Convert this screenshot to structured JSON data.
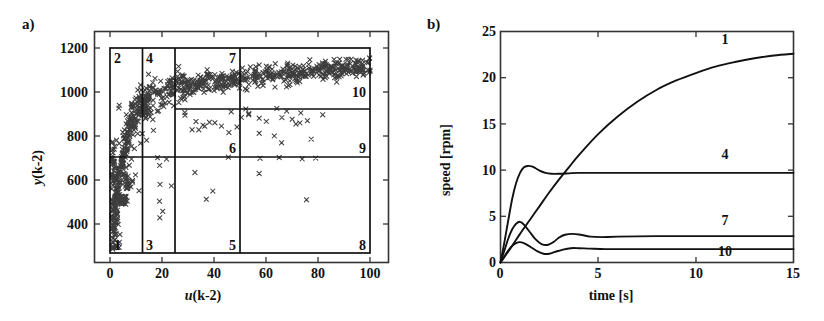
{
  "figure": {
    "panels": [
      {
        "tag": "a)",
        "type": "scatter-with-partition"
      },
      {
        "tag": "b)",
        "type": "line"
      }
    ]
  },
  "panel_a": {
    "tag": "a)",
    "xlabel_plain": "u(k-2)",
    "xlabel_var": "u",
    "xlabel_rest": "(k-2)",
    "ylabel_var": "y",
    "ylabel_rest": "(k-2)",
    "xticks": [
      "0",
      "20",
      "40",
      "60",
      "80",
      "100"
    ],
    "yticks": [
      "400",
      "600",
      "800",
      "1000",
      "1200"
    ],
    "cells": [
      {
        "id": "1",
        "label": "1"
      },
      {
        "id": "2",
        "label": "2"
      },
      {
        "id": "3",
        "label": "3"
      },
      {
        "id": "4",
        "label": "4"
      },
      {
        "id": "5",
        "label": "5"
      },
      {
        "id": "6",
        "label": "6"
      },
      {
        "id": "7",
        "label": "7"
      },
      {
        "id": "8",
        "label": "8"
      },
      {
        "id": "9",
        "label": "9"
      },
      {
        "id": "10",
        "label": "10"
      }
    ]
  },
  "panel_b": {
    "tag": "b)",
    "xlabel": "time  [s]",
    "ylabel": "speed [rpm]",
    "xticks": [
      "0",
      "5",
      "10",
      "15"
    ],
    "yticks": [
      "0",
      "5",
      "10",
      "15",
      "20",
      "25"
    ],
    "curve_labels": [
      "1",
      "4",
      "7",
      "10"
    ]
  },
  "chart_data": [
    {
      "type": "scatter",
      "panel": "a",
      "title": "",
      "xlabel": "u(k-2)",
      "ylabel": "y(k-2)",
      "xlim": [
        -8,
        112
      ],
      "ylim": [
        300,
        1290
      ],
      "xticks": [
        0,
        20,
        40,
        60,
        80,
        100
      ],
      "yticks": [
        400,
        600,
        800,
        1000,
        1200
      ],
      "grid": false,
      "marker": "x",
      "marker_color": "#3b3b3b",
      "partition": {
        "x_boundaries": [
          0,
          12.5,
          25,
          50,
          100
        ],
        "y_boundaries": [
          320,
          760,
          980,
          1215
        ],
        "description": "10 operating regimes partitioning the (u,y) plane",
        "cells": [
          {
            "label": "1",
            "x_range": [
              0,
              12.5
            ],
            "y_range": [
              320,
              760
            ],
            "label_corner": "bottom-left"
          },
          {
            "label": "2",
            "x_range": [
              0,
              12.5
            ],
            "y_range": [
              760,
              1215
            ],
            "label_corner": "top-left"
          },
          {
            "label": "3",
            "x_range": [
              12.5,
              25
            ],
            "y_range": [
              320,
              760
            ],
            "label_corner": "bottom-left"
          },
          {
            "label": "4",
            "x_range": [
              12.5,
              25
            ],
            "y_range": [
              760,
              1215
            ],
            "label_corner": "top-left"
          },
          {
            "label": "5",
            "x_range": [
              25,
              50
            ],
            "y_range": [
              320,
              760
            ],
            "label_corner": "bottom-right"
          },
          {
            "label": "6",
            "x_range": [
              25,
              50
            ],
            "y_range": [
              760,
              980
            ],
            "label_corner": "top-right"
          },
          {
            "label": "7",
            "x_range": [
              25,
              50
            ],
            "y_range": [
              980,
              1215
            ],
            "label_corner": "top-right"
          },
          {
            "label": "8",
            "x_range": [
              50,
              100
            ],
            "y_range": [
              320,
              760
            ],
            "label_corner": "bottom-right"
          },
          {
            "label": "9",
            "x_range": [
              50,
              100
            ],
            "y_range": [
              760,
              980
            ],
            "label_corner": "bottom-right"
          },
          {
            "label": "10",
            "x_range": [
              50,
              100
            ],
            "y_range": [
              980,
              1215
            ],
            "label_corner": "bottom-right"
          }
        ]
      },
      "scatter_summary": "Dense S-shaped band rising from (2,500) through (15,900) to (95,1130); a sparse low-y cloud of isolated points between y=480 and y=760 across all u; moderate cloud between y=760 and y=980 for u>25."
    },
    {
      "type": "line",
      "panel": "b",
      "title": "",
      "xlabel": "time  [s]",
      "ylabel": "speed [rpm]",
      "xlim": [
        0,
        15
      ],
      "ylim": [
        0,
        25
      ],
      "xticks": [
        0,
        5,
        10,
        15
      ],
      "yticks": [
        0,
        5,
        10,
        15,
        20,
        25
      ],
      "grid": false,
      "line_color": "#111111",
      "series": [
        {
          "name": "1",
          "label": "1",
          "label_at": [
            11.5,
            23.6
          ],
          "steady_state": 22.6,
          "x": [
            0,
            0.25,
            0.5,
            0.75,
            1,
            1.5,
            2,
            2.5,
            3,
            3.5,
            4,
            5,
            6,
            7,
            8,
            9,
            10,
            11,
            12,
            13,
            14,
            15
          ],
          "y": [
            0,
            0.75,
            1.5,
            2.3,
            3.1,
            4.6,
            6.1,
            7.6,
            9.0,
            10.3,
            11.6,
            13.9,
            15.8,
            17.4,
            18.7,
            19.7,
            20.5,
            21.2,
            21.7,
            22.1,
            22.4,
            22.6
          ]
        },
        {
          "name": "4",
          "label": "4",
          "label_at": [
            11.5,
            11.2
          ],
          "steady_state": 9.7,
          "x": [
            0,
            0.2,
            0.4,
            0.6,
            0.8,
            1.0,
            1.2,
            1.4,
            1.6,
            1.8,
            2.0,
            2.3,
            2.6,
            3.0,
            3.5,
            4.0,
            5.0,
            7.0,
            10.0,
            15.0
          ],
          "y": [
            0,
            2.2,
            4.6,
            6.9,
            8.6,
            9.7,
            10.3,
            10.45,
            10.4,
            10.2,
            9.95,
            9.7,
            9.6,
            9.6,
            9.65,
            9.7,
            9.7,
            9.7,
            9.7,
            9.7
          ]
        },
        {
          "name": "7",
          "label": "7",
          "label_at": [
            11.5,
            4.1
          ],
          "steady_state": 2.85,
          "x": [
            0,
            0.2,
            0.4,
            0.6,
            0.8,
            1.0,
            1.2,
            1.5,
            1.8,
            2.1,
            2.4,
            2.7,
            3.0,
            3.3,
            3.7,
            4.1,
            4.6,
            5.2,
            6.0,
            8.0,
            11.0,
            15.0
          ],
          "y": [
            0,
            1.3,
            2.6,
            3.6,
            4.2,
            4.4,
            4.1,
            3.3,
            2.5,
            2.0,
            1.9,
            2.2,
            2.7,
            3.0,
            3.1,
            3.0,
            2.8,
            2.75,
            2.8,
            2.85,
            2.85,
            2.85
          ]
        },
        {
          "name": "10",
          "label": "10",
          "label_at": [
            11.5,
            0.75
          ],
          "steady_state": 1.45,
          "x": [
            0,
            0.2,
            0.4,
            0.6,
            0.8,
            1.0,
            1.3,
            1.6,
            1.9,
            2.2,
            2.5,
            2.8,
            3.2,
            3.6,
            4.0,
            4.6,
            5.4,
            7.0,
            10.0,
            15.0
          ],
          "y": [
            0,
            0.65,
            1.3,
            1.8,
            2.1,
            2.2,
            2.0,
            1.6,
            1.2,
            0.95,
            0.95,
            1.15,
            1.4,
            1.55,
            1.55,
            1.5,
            1.45,
            1.45,
            1.45,
            1.45
          ]
        }
      ]
    }
  ]
}
